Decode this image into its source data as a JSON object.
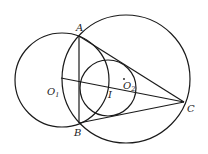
{
  "diagram": {
    "type": "geometry",
    "points": {
      "A": {
        "label": "A",
        "x": 79,
        "y": 36
      },
      "B": {
        "label": "B",
        "x": 79,
        "y": 123
      },
      "C": {
        "label": "C",
        "x": 184,
        "y": 102
      },
      "O1": {
        "label": "O",
        "sub": "1",
        "x": 61,
        "y": 78
      },
      "O2": {
        "label": "O",
        "sub": "2",
        "x": 124,
        "y": 86
      },
      "I": {
        "label": "I",
        "x": 108,
        "y": 88
      }
    },
    "circles": [
      {
        "name": "circle-O1",
        "cx": 62,
        "cy": 80,
        "r": 47
      },
      {
        "name": "circumcircle",
        "cx": 126,
        "cy": 79,
        "r": 64
      },
      {
        "name": "circle-I",
        "cx": 108,
        "cy": 88,
        "r": 28
      }
    ],
    "segments": [
      {
        "name": "segment-AB",
        "from": "A",
        "to": "B"
      },
      {
        "name": "segment-AC",
        "from": "A",
        "to": "C"
      },
      {
        "name": "segment-BC",
        "from": "B",
        "to": "C"
      },
      {
        "name": "segment-O1C",
        "from": "O1",
        "to": "C"
      }
    ],
    "stroke_color": "#1a1a1a"
  }
}
